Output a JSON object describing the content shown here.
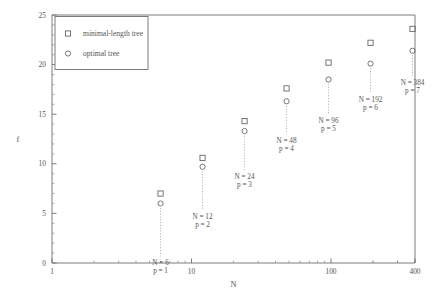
{
  "figure": {
    "background": "#ffffff",
    "axis_color": "#6e6e6e",
    "marker_color": "#5e5e5e",
    "text_color": "#555555"
  },
  "legend": {
    "position": "top-left-inside",
    "entries": [
      {
        "marker": "square-marker",
        "label": "minimal-length tree"
      },
      {
        "marker": "circle-marker",
        "label": "optimal tree"
      }
    ]
  },
  "caption": {
    "text": ""
  },
  "chart_data": {
    "type": "scatter",
    "title": "",
    "xlabel": "N",
    "ylabel": "f",
    "xscale": "log",
    "yscale": "linear",
    "xlim": [
      1,
      400
    ],
    "ylim": [
      0,
      25
    ],
    "grid": false,
    "legend_position": "upper left",
    "xticks": [
      1,
      10,
      100,
      400
    ],
    "xticklabels": [
      "1",
      "10",
      "100",
      "400"
    ],
    "yticks": [
      0,
      5,
      10,
      15,
      20,
      25
    ],
    "yticklabels": [
      "0",
      "5",
      "10",
      "15",
      "20",
      "25"
    ],
    "x": [
      6,
      12,
      24,
      48,
      96,
      192,
      384
    ],
    "series": [
      {
        "name": "minimal-length tree",
        "marker": "square",
        "values": [
          7.0,
          10.6,
          14.3,
          17.6,
          20.2,
          22.2,
          23.6
        ]
      },
      {
        "name": "optimal tree",
        "marker": "circle",
        "values": [
          6.0,
          9.7,
          13.3,
          16.3,
          18.5,
          20.1,
          21.4
        ]
      }
    ],
    "annotations": [
      {
        "x": 6,
        "line1": "N = 6",
        "line2": "p = 1"
      },
      {
        "x": 12,
        "line1": "N = 12",
        "line2": "p = 2"
      },
      {
        "x": 24,
        "line1": "N = 24",
        "line2": "p = 3"
      },
      {
        "x": 48,
        "line1": "N = 48",
        "line2": "p = 4"
      },
      {
        "x": 96,
        "line1": "N = 96",
        "line2": "p = 5"
      },
      {
        "x": 192,
        "line1": "N = 192",
        "line2": "p = 6"
      },
      {
        "x": 384,
        "line1": "N = 384",
        "line2": "p = 7"
      }
    ]
  }
}
